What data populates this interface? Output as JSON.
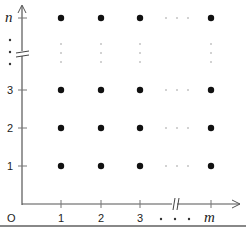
{
  "diagram": {
    "origin_label": "O",
    "x_axis": {
      "ticks": [
        {
          "label": "1",
          "x": 61
        },
        {
          "label": "2",
          "x": 101
        },
        {
          "label": "3",
          "x": 140
        },
        {
          "label": "m",
          "x": 211
        }
      ],
      "ellipsis": "• • •",
      "break_marker": "//"
    },
    "y_axis": {
      "ticks": [
        {
          "label": "1",
          "y": 166
        },
        {
          "label": "2",
          "y": 128
        },
        {
          "label": "3",
          "y": 90
        },
        {
          "label": "n",
          "y": 18
        }
      ],
      "ellipsis": "⋮",
      "break_marker": "="
    },
    "grid_points": "Lattice points (i, j) for i = 1..m, j = 1..n",
    "colors": {
      "points": "#111111",
      "axes": "#555555",
      "dots": "#999999",
      "rule": "#888888"
    }
  }
}
